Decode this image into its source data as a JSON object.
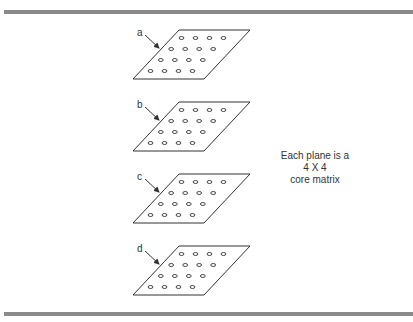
{
  "figure": {
    "caption_lines": [
      "Each plane is a",
      "4 X 4",
      "core matrix"
    ],
    "planes": [
      {
        "label": "a",
        "top": 30
      },
      {
        "label": "b",
        "top": 102
      },
      {
        "label": "c",
        "top": 174
      },
      {
        "label": "d",
        "top": 246
      }
    ],
    "matrix": {
      "rows": 4,
      "cols": 4
    },
    "colors": {
      "rule": "#8a8a8a",
      "line": "#333333"
    }
  }
}
